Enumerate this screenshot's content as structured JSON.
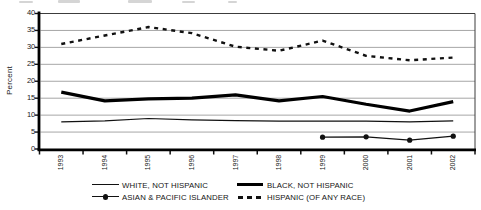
{
  "y_axis": {
    "title": "Percent",
    "ticks": [
      "40",
      "35",
      "30",
      "25",
      "20",
      "15",
      "10",
      "5",
      "0"
    ]
  },
  "x_axis": {
    "ticks": [
      "1993",
      "1994",
      "1995",
      "1996",
      "1997",
      "1998",
      "1999",
      "2000",
      "2001",
      "2002"
    ]
  },
  "legend": [
    {
      "label": "WHITE, NOT HISPANIC",
      "icon": "thin-line-icon"
    },
    {
      "label": "BLACK, NOT HISPANIC",
      "icon": "thick-line-icon"
    },
    {
      "label": "ASIAN & PACIFIC ISLANDER",
      "icon": "line-with-dot-icon"
    },
    {
      "label": "HISPANIC (OF ANY RACE)",
      "icon": "dashed-line-icon"
    }
  ],
  "colors": {
    "line": "#111111",
    "grid": "#9c9c9c",
    "axis": "#000000",
    "text": "#1a1a1a",
    "background": "#ffffff"
  },
  "chart_data": {
    "type": "line",
    "title": "",
    "xlabel": "",
    "ylabel": "Percent",
    "categories": [
      "1993",
      "1994",
      "1995",
      "1996",
      "1997",
      "1998",
      "1999",
      "2000",
      "2001",
      "2002"
    ],
    "ylim": [
      0,
      40
    ],
    "ytick_step": 5,
    "grid": "horizontal",
    "legend_position": "bottom",
    "series": [
      {
        "name": "WHITE, NOT HISPANIC",
        "style": "thin",
        "values": [
          8.0,
          8.3,
          9.0,
          8.6,
          8.4,
          8.2,
          8.2,
          8.2,
          8.0,
          8.3
        ]
      },
      {
        "name": "BLACK, NOT HISPANIC",
        "style": "thick",
        "values": [
          16.8,
          14.2,
          14.8,
          15.0,
          16.0,
          14.2,
          15.5,
          13.2,
          11.2,
          14.0
        ]
      },
      {
        "name": "ASIAN & PACIFIC ISLANDER",
        "style": "marker",
        "values": [
          null,
          null,
          null,
          null,
          null,
          null,
          3.5,
          3.6,
          2.6,
          3.8
        ]
      },
      {
        "name": "HISPANIC (OF ANY RACE)",
        "style": "dashed",
        "values": [
          31.0,
          33.5,
          36.0,
          34.2,
          30.2,
          29.0,
          32.0,
          27.5,
          26.2,
          27.0
        ]
      }
    ]
  }
}
